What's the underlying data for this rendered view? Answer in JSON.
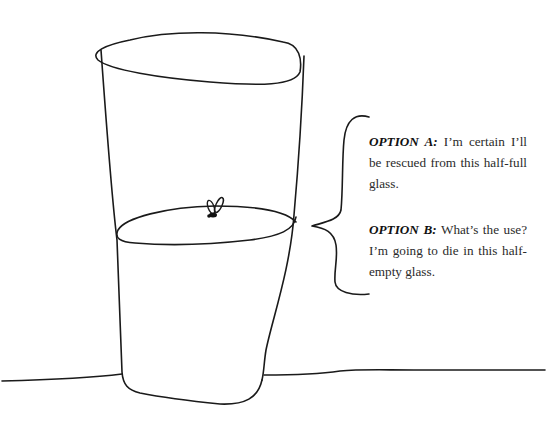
{
  "illustration": {
    "subject": "half-filled glass with a fly on the liquid surface",
    "ink_color": "#1a1a1a",
    "background_color": "#ffffff"
  },
  "options": [
    {
      "label": "OPTION A:",
      "text": "I’m certain I’ll be rescued from this half-full glass."
    },
    {
      "label": "OPTION B:",
      "text": "What’s the use? I’m going to die in this half-empty glass."
    }
  ]
}
